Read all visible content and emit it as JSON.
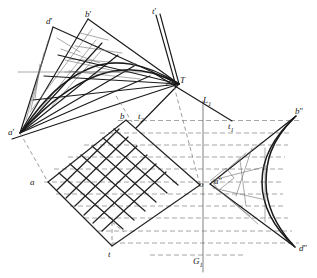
{
  "figure": {
    "type": "line-diagram",
    "width": 317,
    "height": 278,
    "background_color": "#ffffff",
    "stroke_color": "#1a1a1a",
    "dashed_color": "#7a7a7a",
    "thin_color": "#6b6b6b"
  },
  "labels": [
    {
      "id": "d-prime",
      "text": "d",
      "prime": "′",
      "x": 46,
      "y": 17,
      "name": "label-d-prime"
    },
    {
      "id": "b-prime",
      "text": "b",
      "prime": "′",
      "x": 85,
      "y": 10,
      "name": "label-b-prime"
    },
    {
      "id": "t-prime",
      "text": "t",
      "prime": "′",
      "x": 152,
      "y": 7,
      "name": "label-t-prime"
    },
    {
      "id": "T-point",
      "text": "T",
      "prime": "",
      "x": 180,
      "y": 76,
      "name": "label-T"
    },
    {
      "id": "c-prime",
      "text": "c",
      "prime": "′",
      "x": 166,
      "y": 80,
      "name": "label-c-prime"
    },
    {
      "id": "L-one",
      "text": "L",
      "prime": "",
      "sub": "1",
      "x": 203,
      "y": 96,
      "name": "label-L1"
    },
    {
      "id": "b-double",
      "text": "b",
      "prime": "″",
      "x": 295,
      "y": 107,
      "name": "label-b-double-prime"
    },
    {
      "id": "a-prime",
      "text": "a",
      "prime": "′",
      "x": 8,
      "y": 128,
      "name": "label-a-prime"
    },
    {
      "id": "b-point",
      "text": "b",
      "prime": "",
      "x": 120,
      "y": 112,
      "name": "label-b"
    },
    {
      "id": "t-two",
      "text": "t",
      "prime": "",
      "sub": "2",
      "x": 138,
      "y": 112,
      "name": "label-t2"
    },
    {
      "id": "t-one",
      "text": "t",
      "prime": "",
      "sub": "1",
      "x": 228,
      "y": 122,
      "name": "label-t1"
    },
    {
      "id": "a-point",
      "text": "a",
      "prime": "",
      "x": 30,
      "y": 178,
      "name": "label-a"
    },
    {
      "id": "o-point",
      "text": "o",
      "prime": "",
      "x": 199,
      "y": 180,
      "name": "label-o"
    },
    {
      "id": "a-double",
      "text": "a",
      "prime": "″",
      "x": 214,
      "y": 177,
      "name": "label-a-double-prime"
    },
    {
      "id": "t-point",
      "text": "t",
      "prime": "",
      "x": 108,
      "y": 250,
      "name": "label-t"
    },
    {
      "id": "G-one",
      "text": "G",
      "prime": "",
      "sub": "1",
      "x": 193,
      "y": 257,
      "name": "label-G1"
    },
    {
      "id": "d-double",
      "text": "d",
      "prime": "″",
      "x": 299,
      "y": 244,
      "name": "label-d-double-prime"
    }
  ],
  "key_points": {
    "a_prime": {
      "x": 20,
      "y": 133
    },
    "b_prime": {
      "x": 88,
      "y": 19
    },
    "d_prime": {
      "x": 53,
      "y": 27
    },
    "t_prime": {
      "x": 156,
      "y": 15
    },
    "c_prime": {
      "x": 174,
      "y": 85
    },
    "T": {
      "x": 179,
      "y": 84
    },
    "a": {
      "x": 48,
      "y": 182
    },
    "b": {
      "x": 126,
      "y": 120
    },
    "o": {
      "x": 200,
      "y": 185
    },
    "t": {
      "x": 112,
      "y": 246
    },
    "a_dbl": {
      "x": 210,
      "y": 184
    },
    "b_dbl": {
      "x": 296,
      "y": 116
    },
    "d_dbl": {
      "x": 295,
      "y": 247
    },
    "G1_x": 203,
    "L1_x": 203
  },
  "grid": {
    "description": "rotated square lattice (diamond) with 7 by 7 cells",
    "rows": 7,
    "cols": 7,
    "corner_left": {
      "x": 48,
      "y": 182
    },
    "corner_top": {
      "x": 126,
      "y": 120
    },
    "corner_right": {
      "x": 200,
      "y": 185
    },
    "corner_bottom": {
      "x": 112,
      "y": 246
    }
  },
  "dashed_lines": {
    "count": 11,
    "orientation": "horizontal",
    "note": "projection lines from grid vertices to the right-hand astroid"
  },
  "envelope_left": {
    "description": "tangent-line envelope fan between apexes d-prime, b-prime and a-prime/c-prime",
    "fan_count": 8
  },
  "envelope_right": {
    "description": "cusped astroid arc between b-double-prime, a-double-prime and d-double-prime",
    "fan_count": 6
  }
}
